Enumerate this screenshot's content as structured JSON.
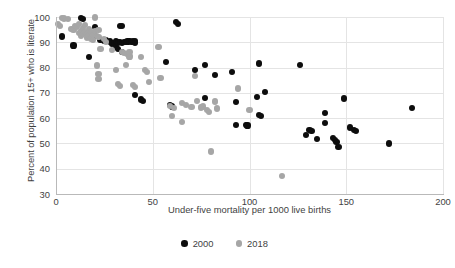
{
  "chart_data": {
    "type": "scatter",
    "title": "",
    "xlabel": "Under-five mortality per 1000 live births",
    "ylabel": "Percent of population 15+ who is literate",
    "xlim": [
      0,
      200
    ],
    "ylim": [
      30,
      100
    ],
    "xticks": [
      0,
      50,
      100,
      150,
      200
    ],
    "yticks": [
      30,
      40,
      50,
      60,
      70,
      80,
      90,
      100
    ],
    "grid": true,
    "legend_position": "bottom-center",
    "colors": {
      "2000": "#0d0d0d",
      "2018": "#a6a6a6",
      "gridline": "#e4e4e4",
      "axis": "#b9b9b9",
      "text": "#3f3f3f",
      "background": "#ffffff"
    },
    "series": [
      {
        "name": "2000",
        "color": "#0d0d0d",
        "points": [
          [
            3,
            92.3
          ],
          [
            9,
            88.7
          ],
          [
            17,
            84.2
          ],
          [
            13,
            99.6
          ],
          [
            14,
            99.3
          ],
          [
            20,
            96.2
          ],
          [
            20,
            92.6
          ],
          [
            23,
            91.0
          ],
          [
            25,
            90.6
          ],
          [
            26,
            90.9
          ],
          [
            28,
            90.3
          ],
          [
            29,
            89.5
          ],
          [
            30,
            89.8
          ],
          [
            31,
            90.4
          ],
          [
            31,
            88.2
          ],
          [
            32,
            89.9
          ],
          [
            32,
            87.2
          ],
          [
            33,
            96.6
          ],
          [
            34,
            96.5
          ],
          [
            33,
            90.2
          ],
          [
            34,
            89.7
          ],
          [
            34,
            86.3
          ],
          [
            35,
            90.1
          ],
          [
            36,
            90.2
          ],
          [
            37,
            90.3
          ],
          [
            38,
            90.5
          ],
          [
            39,
            90.2
          ],
          [
            40,
            90.3
          ],
          [
            41,
            90.6
          ],
          [
            41,
            89.8
          ],
          [
            41,
            69.1
          ],
          [
            44,
            67.4
          ],
          [
            45,
            66.9
          ],
          [
            57,
            82.1
          ],
          [
            62,
            98.0
          ],
          [
            63,
            97.3
          ],
          [
            59,
            65.2
          ],
          [
            60,
            64.6
          ],
          [
            72,
            79.1
          ],
          [
            77,
            81.1
          ],
          [
            77,
            68.0
          ],
          [
            82,
            77.1
          ],
          [
            91,
            78.4
          ],
          [
            93,
            66.3
          ],
          [
            93,
            57.2
          ],
          [
            98,
            57.4
          ],
          [
            99,
            57.1
          ],
          [
            104,
            68.4
          ],
          [
            105,
            81.6
          ],
          [
            105,
            61.3
          ],
          [
            106,
            60.8
          ],
          [
            108,
            70.2
          ],
          [
            126,
            80.9
          ],
          [
            129,
            53.4
          ],
          [
            131,
            55.2
          ],
          [
            132,
            54.9
          ],
          [
            135,
            51.8
          ],
          [
            139,
            61.9
          ],
          [
            139,
            58.2
          ],
          [
            143,
            52.2
          ],
          [
            144,
            51.4
          ],
          [
            145,
            50.6
          ],
          [
            146,
            48.6
          ],
          [
            149,
            67.8
          ],
          [
            152,
            56.3
          ],
          [
            154,
            55.3
          ],
          [
            155,
            55.0
          ],
          [
            172,
            50.0
          ],
          [
            184,
            64.0
          ]
        ]
      },
      {
        "name": "2018",
        "color": "#a6a6a6",
        "points": [
          [
            1,
            97.1
          ],
          [
            2,
            96.4
          ],
          [
            3,
            99.7
          ],
          [
            4,
            99.4
          ],
          [
            6,
            99.2
          ],
          [
            8,
            95.1
          ],
          [
            9,
            94.8
          ],
          [
            10,
            96.3
          ],
          [
            11,
            95.9
          ],
          [
            12,
            93.7
          ],
          [
            12,
            97.2
          ],
          [
            13,
            94.4
          ],
          [
            13,
            92.4
          ],
          [
            14,
            95.6
          ],
          [
            14,
            93.2
          ],
          [
            15,
            96.8
          ],
          [
            15,
            94.0
          ],
          [
            16,
            93.4
          ],
          [
            16,
            91.9
          ],
          [
            17,
            95.2
          ],
          [
            17,
            92.7
          ],
          [
            18,
            94.1
          ],
          [
            18,
            91.5
          ],
          [
            19,
            93.0
          ],
          [
            19,
            90.9
          ],
          [
            20,
            94.6
          ],
          [
            20,
            99.8
          ],
          [
            21,
            92.6
          ],
          [
            22,
            95.0
          ],
          [
            22,
            92.2
          ],
          [
            23,
            87.3
          ],
          [
            21,
            80.8
          ],
          [
            22,
            77.4
          ],
          [
            22,
            75.6
          ],
          [
            25,
            91.3
          ],
          [
            26,
            90.0
          ],
          [
            29,
            86.8
          ],
          [
            31,
            79.0
          ],
          [
            32,
            73.6
          ],
          [
            33,
            72.8
          ],
          [
            34,
            86.2
          ],
          [
            35,
            85.8
          ],
          [
            36,
            81.1
          ],
          [
            37,
            85.5
          ],
          [
            38,
            84.4
          ],
          [
            38,
            86.0
          ],
          [
            40,
            73.0
          ],
          [
            41,
            72.2
          ],
          [
            44,
            84.1
          ],
          [
            46,
            79.1
          ],
          [
            47,
            78.4
          ],
          [
            48,
            74.4
          ],
          [
            53,
            88.1
          ],
          [
            54,
            76.0
          ],
          [
            59,
            64.8
          ],
          [
            60,
            61.0
          ],
          [
            61,
            63.9
          ],
          [
            65,
            66.1
          ],
          [
            65,
            58.4
          ],
          [
            67,
            65.2
          ],
          [
            70,
            64.5
          ],
          [
            72,
            76.6
          ],
          [
            73,
            66.9
          ],
          [
            75,
            64.2
          ],
          [
            76,
            64.6
          ],
          [
            78,
            63.1
          ],
          [
            79,
            62.3
          ],
          [
            80,
            46.8
          ],
          [
            82,
            66.6
          ],
          [
            83,
            63.8
          ],
          [
            94,
            71.7
          ],
          [
            100,
            63.3
          ],
          [
            117,
            37.0
          ]
        ]
      }
    ]
  },
  "axes": {
    "x_title": "Under-five mortality per 1000 live births",
    "y_title": "Percent of population 15+ who is literate",
    "x_tick_labels": [
      "0",
      "50",
      "100",
      "150",
      "200"
    ],
    "y_tick_labels": [
      "100",
      "90",
      "80",
      "70",
      "60",
      "50",
      "40",
      "30"
    ]
  },
  "legend": {
    "items": [
      {
        "label": "2000",
        "color": "#0d0d0d",
        "marker": "circle-marker"
      },
      {
        "label": "2018",
        "color": "#a6a6a6",
        "marker": "circle-marker"
      }
    ]
  }
}
